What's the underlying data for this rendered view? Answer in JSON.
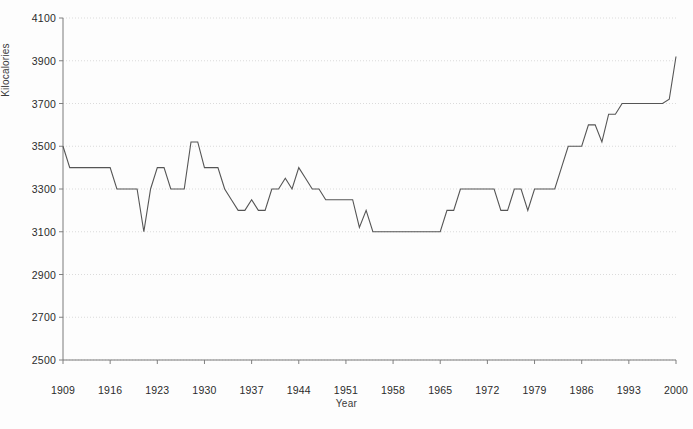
{
  "chart_data": {
    "type": "line",
    "title": "",
    "xlabel": "Year",
    "ylabel": "Kilocalories",
    "xlim": [
      1909,
      2000
    ],
    "ylim": [
      2500,
      4100
    ],
    "ytick_step": 200,
    "xtick_step": 7,
    "grid": true,
    "legend": "none",
    "line_color": "#555555",
    "grid_color": "#cccccc",
    "axis_color": "#808080",
    "background_color": "#ffffff",
    "yticks": [
      2500,
      2700,
      2900,
      3100,
      3300,
      3500,
      3700,
      3900,
      4100
    ],
    "xticks": [
      1909,
      1916,
      1923,
      1930,
      1937,
      1944,
      1951,
      1958,
      1965,
      1972,
      1979,
      1986,
      1993,
      2000
    ],
    "x": [
      1909,
      1910,
      1911,
      1912,
      1913,
      1914,
      1915,
      1916,
      1917,
      1918,
      1919,
      1920,
      1921,
      1922,
      1923,
      1924,
      1925,
      1926,
      1927,
      1928,
      1929,
      1930,
      1931,
      1932,
      1933,
      1934,
      1935,
      1936,
      1937,
      1938,
      1939,
      1940,
      1941,
      1942,
      1943,
      1944,
      1945,
      1946,
      1947,
      1948,
      1949,
      1950,
      1951,
      1952,
      1953,
      1954,
      1955,
      1956,
      1957,
      1958,
      1959,
      1960,
      1961,
      1962,
      1963,
      1964,
      1965,
      1966,
      1967,
      1968,
      1969,
      1970,
      1971,
      1972,
      1973,
      1974,
      1975,
      1976,
      1977,
      1978,
      1979,
      1980,
      1981,
      1982,
      1983,
      1984,
      1985,
      1986,
      1987,
      1988,
      1989,
      1990,
      1991,
      1992,
      1993,
      1994,
      1995,
      1996,
      1997,
      1998,
      1999,
      2000
    ],
    "y": [
      3500,
      3400,
      3400,
      3400,
      3400,
      3400,
      3400,
      3400,
      3300,
      3300,
      3300,
      3300,
      3100,
      3300,
      3400,
      3400,
      3300,
      3300,
      3300,
      3400,
      3400,
      3400,
      3400,
      3400,
      3400,
      3400,
      3400,
      3300,
      3300,
      3300,
      3300,
      3400,
      3400,
      3400,
      3400,
      3400,
      3300,
      3300,
      3300,
      3300,
      3300,
      3300,
      3300,
      3300,
      3300,
      3300,
      3300,
      3300,
      3300,
      3300,
      3300,
      3300,
      3300,
      3300,
      3300,
      3300,
      3300,
      3300,
      3300,
      3300,
      3300,
      3300,
      3300,
      3300,
      3300,
      3300,
      3300,
      3300,
      3300,
      3300,
      3300,
      3300,
      3300,
      3300,
      3300,
      3300,
      3300,
      3300,
      3300,
      3300,
      3300,
      3300,
      3300,
      3300,
      3300,
      3300,
      3300,
      3300,
      3300,
      3300,
      3300,
      3920
    ],
    "y_actual": [
      3500,
      3400,
      3400,
      3400,
      3400,
      3400,
      3400,
      3400,
      3300,
      3300,
      3300,
      3300,
      3100,
      3300,
      3400,
      3400,
      3300,
      3300,
      3300,
      3520,
      3520,
      3400,
      3400,
      3400,
      3300,
      3250,
      3200,
      3200,
      3250,
      3200,
      3200,
      3300,
      3300,
      3350,
      3300,
      3400,
      3350,
      3300,
      3300,
      3250,
      3250,
      3250,
      3250,
      3250,
      3120,
      3200,
      3100,
      3100,
      3100,
      3100,
      3100,
      3100,
      3100,
      3100,
      3100,
      3100,
      3100,
      3200,
      3200,
      3300,
      3300,
      3300,
      3300,
      3300,
      3300,
      3200,
      3200,
      3300,
      3300,
      3200,
      3300,
      3300,
      3300,
      3300,
      3400,
      3500,
      3500,
      3500,
      3600,
      3600,
      3520,
      3650,
      3650,
      3700,
      3700,
      3700,
      3700,
      3700,
      3700,
      3700,
      3720,
      3920
    ]
  }
}
